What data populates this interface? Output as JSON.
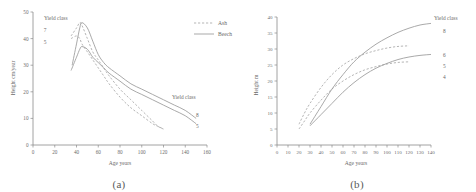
{
  "figure": {
    "panel_a_caption": "(a)",
    "panel_b_caption": "(b)"
  },
  "legend": {
    "ash_label": "Ash",
    "beech_label": "Beech"
  },
  "panel_a": {
    "yield_class_title_left": "Yield class",
    "yield_class_title_right": "Yield class",
    "left_label_7": "7",
    "left_label_5": "5",
    "right_label_8": "8",
    "right_label_5": "5",
    "y_ticks": [
      "0",
      "10",
      "20",
      "30",
      "40",
      "50"
    ],
    "x_ticks": [
      "0",
      "20",
      "40",
      "60",
      "80",
      "100",
      "120",
      "140",
      "160"
    ],
    "xlabel": "Age years",
    "ylabel": "Height cm/year"
  },
  "panel_b": {
    "yield_class_title": "Yield class",
    "label_8": "8",
    "label_6": "6",
    "label_5": "5",
    "label_4": "4",
    "y_ticks": [
      "0",
      "5",
      "10",
      "15",
      "20",
      "25",
      "30",
      "35",
      "40"
    ],
    "x_ticks": [
      "0",
      "10",
      "20",
      "30",
      "40",
      "50",
      "60",
      "70",
      "80",
      "90",
      "100",
      "110",
      "120",
      "130",
      "140"
    ],
    "xlabel": "Age years",
    "ylabel": "Height m"
  },
  "chart_data": [
    {
      "type": "line",
      "panel": "(a)",
      "title": "",
      "xlabel": "Age years",
      "ylabel": "Height cm/year",
      "xlim": [
        0,
        160
      ],
      "ylim": [
        0,
        50
      ],
      "xticks": [
        0,
        20,
        40,
        60,
        80,
        100,
        120,
        140,
        160
      ],
      "yticks": [
        0,
        10,
        20,
        30,
        40,
        50
      ],
      "grid": false,
      "legend": [
        "Ash",
        "Beech"
      ],
      "legend_position": "top-right",
      "annotations": [
        "Yield class",
        "7",
        "5",
        "Yield class",
        "8",
        "5"
      ],
      "series": [
        {
          "name": "Ash yield class 7",
          "style": "dashed",
          "x": [
            35,
            40,
            43,
            45,
            50,
            55,
            60,
            65,
            70,
            80,
            90,
            100,
            110,
            115,
            120
          ],
          "y": [
            41,
            44,
            46,
            45,
            40,
            35,
            32,
            29,
            26,
            21,
            17,
            13,
            9,
            7,
            6
          ]
        },
        {
          "name": "Ash yield class 5",
          "style": "dashed",
          "x": [
            35,
            40,
            43,
            45,
            50,
            55,
            60,
            65,
            70,
            80,
            90,
            100,
            110,
            115,
            120
          ],
          "y": [
            40,
            41,
            40,
            38,
            35,
            32,
            29,
            26,
            23,
            18,
            14,
            11,
            8,
            7,
            6
          ]
        },
        {
          "name": "Beech yield class 8",
          "style": "solid",
          "x": [
            36,
            40,
            43,
            45,
            50,
            55,
            60,
            65,
            70,
            80,
            90,
            100,
            110,
            120,
            130,
            140,
            150
          ],
          "y": [
            30,
            38,
            44,
            46,
            44,
            39,
            34,
            31,
            29,
            26,
            23,
            21,
            19,
            17,
            15,
            13,
            10
          ]
        },
        {
          "name": "Beech yield class 5",
          "style": "solid",
          "x": [
            35,
            40,
            43,
            45,
            50,
            55,
            60,
            65,
            70,
            80,
            90,
            100,
            110,
            120,
            130,
            140,
            150
          ],
          "y": [
            28,
            33,
            36,
            37,
            36,
            33,
            31,
            29,
            27,
            24,
            21,
            19,
            17,
            15,
            13,
            11,
            8
          ]
        }
      ]
    },
    {
      "type": "line",
      "panel": "(b)",
      "title": "",
      "xlabel": "Age years",
      "ylabel": "Height m",
      "xlim": [
        0,
        140
      ],
      "ylim": [
        0,
        40
      ],
      "xticks": [
        0,
        10,
        20,
        30,
        40,
        50,
        60,
        70,
        80,
        90,
        100,
        110,
        120,
        130,
        140
      ],
      "yticks": [
        0,
        5,
        10,
        15,
        20,
        25,
        30,
        35,
        40
      ],
      "grid": false,
      "legend": [
        "Ash",
        "Beech"
      ],
      "legend_position": "outside-left",
      "annotations": [
        "Yield class",
        "8",
        "6",
        "5",
        "4"
      ],
      "series": [
        {
          "name": "Ash yield class 6",
          "style": "dashed",
          "x": [
            20,
            25,
            30,
            40,
            50,
            60,
            70,
            80,
            90,
            100,
            110,
            120
          ],
          "y": [
            6.5,
            10,
            13,
            18,
            22,
            25,
            27,
            28.5,
            29.5,
            30.3,
            30.8,
            31
          ]
        },
        {
          "name": "Ash yield class 4",
          "style": "dashed",
          "x": [
            20,
            25,
            30,
            40,
            50,
            60,
            70,
            80,
            90,
            100,
            110,
            120
          ],
          "y": [
            5,
            7.5,
            10,
            14,
            17.5,
            20,
            22,
            23.5,
            24.5,
            25.3,
            25.8,
            26
          ]
        },
        {
          "name": "Beech yield class 8",
          "style": "solid",
          "x": [
            30,
            40,
            50,
            60,
            70,
            80,
            90,
            100,
            110,
            120,
            130,
            140
          ],
          "y": [
            6.5,
            12,
            17.5,
            22,
            26,
            29,
            31.5,
            33.5,
            35.2,
            36.5,
            37.5,
            38
          ]
        },
        {
          "name": "Beech yield class 5",
          "style": "solid",
          "x": [
            30,
            40,
            50,
            60,
            70,
            80,
            90,
            100,
            110,
            120,
            130,
            140
          ],
          "y": [
            6,
            9.5,
            13,
            16.5,
            19.5,
            22,
            24,
            25.5,
            26.7,
            27.5,
            28,
            28.3
          ]
        }
      ]
    }
  ]
}
